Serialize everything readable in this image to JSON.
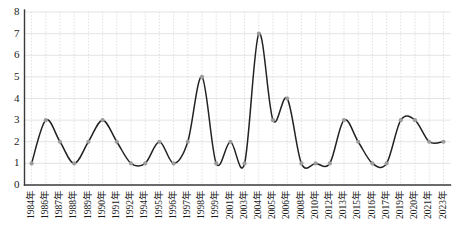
{
  "chart_data": {
    "type": "line",
    "title": "",
    "subtitle": "",
    "xlabel": "",
    "ylabel": "",
    "categories": [
      "1984年",
      "1986年",
      "1987年",
      "1988年",
      "1989年",
      "1990年",
      "1991年",
      "1992年",
      "1994年",
      "1995年",
      "1996年",
      "1997年",
      "1998年",
      "1999年",
      "2001年",
      "2003年",
      "2004年",
      "2005年",
      "2006年",
      "2008年",
      "2010年",
      "2012年",
      "2013年",
      "2015年",
      "2016年",
      "2017年",
      "2019年",
      "2020年",
      "2021年",
      "2023年"
    ],
    "values": [
      1,
      3,
      2,
      1,
      2,
      3,
      2,
      1,
      1,
      2,
      1,
      2,
      5,
      1,
      2,
      1,
      7,
      3,
      4,
      1,
      1,
      1,
      3,
      2,
      1,
      1,
      3,
      3,
      2,
      2
    ],
    "series": [
      {
        "name": "",
        "values": [
          1,
          3,
          2,
          1,
          2,
          3,
          2,
          1,
          1,
          2,
          1,
          2,
          5,
          1,
          2,
          1,
          7,
          3,
          4,
          1,
          1,
          1,
          3,
          2,
          1,
          1,
          3,
          3,
          2,
          2
        ]
      }
    ],
    "ylim": [
      0,
      8
    ],
    "yticks": [
      0,
      1,
      2,
      3,
      4,
      5,
      6,
      7,
      8
    ],
    "ytick_labels": [
      "0",
      "1",
      "2",
      "3",
      "4",
      "5",
      "6",
      "7",
      "8"
    ],
    "grid": true,
    "grid_x": true,
    "grid_y": true,
    "legend": false,
    "legend_position": "none",
    "smoothing": "spline",
    "marker": "circle",
    "marker_color": "#9b9b9b",
    "line_color": "#222222",
    "grid_color": "#d6d6d6",
    "axis_color": "#3a3a3a",
    "background_color": "#ffffff",
    "annotations": []
  }
}
